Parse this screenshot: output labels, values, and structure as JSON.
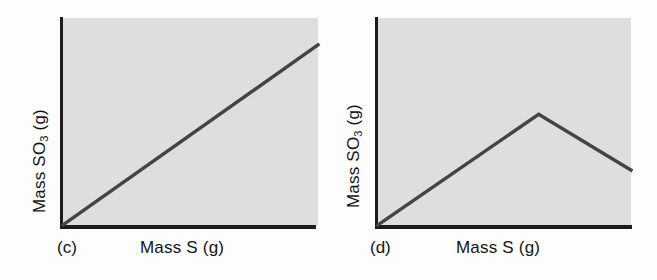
{
  "figure": {
    "background_color": "#fdfdfd",
    "plot_fill_color": "#dedede",
    "axis_color": "#1c1c1c",
    "line_color": "#444444"
  },
  "panels": [
    {
      "tag": "(c)",
      "xlabel": "Mass S (g)",
      "ylabel_main": "Mass SO",
      "ylabel_sub": "3",
      "ylabel_unit": " (g)"
    },
    {
      "tag": "(d)",
      "xlabel": "Mass S (g)",
      "ylabel_main": "Mass SO",
      "ylabel_sub": "3",
      "ylabel_unit": " (g)"
    }
  ],
  "chart_data": [
    {
      "type": "line",
      "title": "(c)",
      "xlabel": "Mass S (g)",
      "ylabel": "Mass SO3 (g)",
      "xlim": [
        0,
        1
      ],
      "ylim": [
        0,
        1
      ],
      "grid": false,
      "legend": "none",
      "axis_ticks": "none",
      "annotation": "Straight line of constant positive slope through the origin: mass of SO3 increases in direct proportion to mass of S.",
      "series": [
        {
          "name": "Mass SO3 vs Mass S",
          "x": [
            0,
            1
          ],
          "y": [
            0,
            0.87
          ]
        }
      ]
    },
    {
      "type": "line",
      "title": "(d)",
      "xlabel": "Mass S (g)",
      "ylabel": "Mass SO3 (g)",
      "xlim": [
        0,
        1
      ],
      "ylim": [
        0,
        1
      ],
      "grid": false,
      "legend": "none",
      "axis_ticks": "none",
      "annotation": "Line rises from the origin to a peak, then falls away with a shallower negative slope.",
      "series": [
        {
          "name": "Mass SO3 vs Mass S",
          "x": [
            0,
            0.635,
            1
          ],
          "y": [
            0,
            0.535,
            0.265
          ]
        }
      ]
    }
  ]
}
